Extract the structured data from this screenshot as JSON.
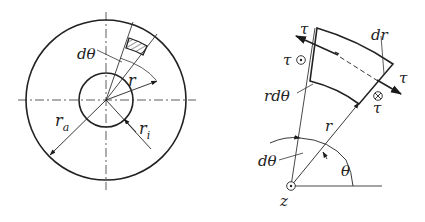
{
  "left_figure": {
    "labels": {
      "dtheta": "dθ",
      "r": "r",
      "r_a_main": "r",
      "r_a_sub": "a",
      "r_i_main": "r",
      "r_i_sub": "i"
    }
  },
  "right_figure": {
    "labels": {
      "tau_top": "τ",
      "tau_dot": "τ",
      "dr": "dr",
      "tau_right": "τ",
      "tau_bottom": "τ",
      "rdtheta": "rdθ",
      "r": "r",
      "dtheta": "dθ",
      "theta": "θ",
      "z": "z"
    }
  },
  "colors": {
    "stroke": "#2a2a2a",
    "background": "#ffffff"
  }
}
